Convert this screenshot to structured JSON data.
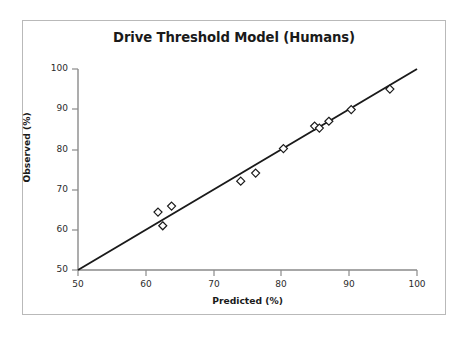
{
  "figure": {
    "background_color": "#ffffff",
    "frame_border_color": "#b9b9b9",
    "axis_color": "#8a8a8a",
    "line_color": "#1a1a1a",
    "marker_color": "#1a1a1a",
    "text_color": "#1a1a1a"
  },
  "chart_data": {
    "type": "scatter",
    "title": "Drive Threshold Model (Humans)",
    "xlabel": "Predicted (%)",
    "ylabel": "Observed (%)",
    "xlim": [
      50,
      100
    ],
    "ylim": [
      50,
      100
    ],
    "xticks": [
      50,
      60,
      70,
      80,
      90,
      100
    ],
    "yticks": [
      50,
      60,
      70,
      80,
      90,
      100
    ],
    "xtick_labels": [
      "50",
      "60",
      "70",
      "80",
      "90",
      "100"
    ],
    "ytick_labels": [
      "50",
      "60",
      "70",
      "80",
      "90",
      "100"
    ],
    "grid": false,
    "legend": false,
    "marker": "diamond-open",
    "series": [
      {
        "name": "Observed vs Predicted",
        "points": [
          {
            "x": 61.8,
            "y": 64.4
          },
          {
            "x": 62.5,
            "y": 61.0
          },
          {
            "x": 63.8,
            "y": 65.9
          },
          {
            "x": 74.0,
            "y": 72.1
          },
          {
            "x": 76.2,
            "y": 74.1
          },
          {
            "x": 80.3,
            "y": 80.2
          },
          {
            "x": 84.9,
            "y": 85.8
          },
          {
            "x": 85.6,
            "y": 85.3
          },
          {
            "x": 87.0,
            "y": 87.0
          },
          {
            "x": 90.3,
            "y": 89.9
          },
          {
            "x": 96.0,
            "y": 95.0
          }
        ]
      }
    ],
    "reference_line": {
      "name": "identity-line",
      "from": {
        "x": 50,
        "y": 50
      },
      "to": {
        "x": 100,
        "y": 100
      }
    }
  }
}
